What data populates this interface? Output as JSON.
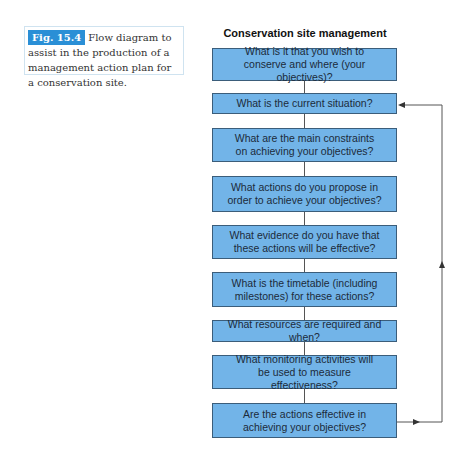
{
  "caption": {
    "label": "Fig. 15.4",
    "text": "Flow diagram to assist in the production of a management action plan for a conservation site."
  },
  "diagram": {
    "title": "Conservation site management",
    "steps": [
      {
        "text": "What is it that you wish to conserve and where (your objectives)?"
      },
      {
        "text": "What is the current situation?"
      },
      {
        "text": "What are the main constraints on achieving your objectives?"
      },
      {
        "text": "What actions do you propose in order to achieve your objectives?"
      },
      {
        "text": "What evidence do you have that these actions will be effective?"
      },
      {
        "text": "What is the timetable (including milestones) for these actions?"
      },
      {
        "text": "What resources are required and when?"
      },
      {
        "text": "What monitoring activities will be used to measure effectiveness?"
      },
      {
        "text": "Are the actions effective in achieving your objectives?"
      }
    ],
    "feedback": {
      "from_step": 9,
      "to_step": 2
    }
  },
  "colors": {
    "box_fill": "#72b4e8",
    "box_border": "#3b5d7a",
    "label_bg": "#2a8fd6"
  }
}
